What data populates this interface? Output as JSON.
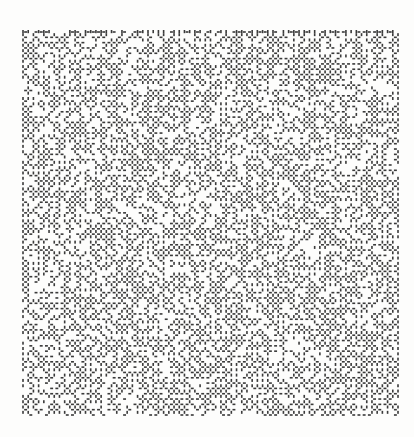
{
  "image": {
    "description": "Printed maze-like pattern of short dash wall segments on a square grid",
    "width": 414,
    "height": 437,
    "background": "#fdfdfc"
  },
  "maze": {
    "x": 23,
    "y": 32,
    "width": 375,
    "height": 383,
    "cols": 72,
    "rows": 72,
    "wall_color": "#3a3a3a",
    "wall_thickness": 1.6,
    "seed": 1979,
    "horizontal_wall_probability": 0.62,
    "vertical_wall_probability": 0.64
  }
}
